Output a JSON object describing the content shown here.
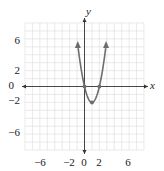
{
  "chart_data": {
    "type": "line",
    "title": "",
    "xlabel": "x",
    "ylabel": "y",
    "xlim": [
      -8,
      8
    ],
    "ylim": [
      -8,
      8
    ],
    "grid": true,
    "x_tick_labels": [
      "-6",
      "-2",
      "0",
      "2",
      "6"
    ],
    "x_ticks": [
      -6,
      -2,
      0,
      2,
      6
    ],
    "y_tick_labels": [
      "6",
      "2",
      "0",
      "-2",
      "-6"
    ],
    "y_ticks": [
      6,
      2,
      0,
      -2,
      -6
    ],
    "series": [
      {
        "name": "parabola",
        "equation": "y = 2x^2 - 4x",
        "x": [
          -0.9,
          -0.5,
          0,
          0.5,
          1,
          1.5,
          2,
          2.5,
          2.9
        ],
        "y": [
          7.22,
          2.5,
          0,
          -1.5,
          -2,
          -1.5,
          0,
          2.5,
          7.22
        ],
        "marked_points": [
          [
            0,
            0
          ],
          [
            1,
            -2
          ],
          [
            2,
            0
          ]
        ],
        "arrows_at_ends": true
      }
    ]
  },
  "labels": {
    "x_axis": "x",
    "y_axis": "y",
    "xt0": "−6",
    "xt1": "−2",
    "xt2": "0",
    "xt3": "2",
    "xt4": "6",
    "yt0": "6",
    "yt1": "2",
    "yt2": "0",
    "yt3": "−2",
    "yt4": "−6"
  }
}
